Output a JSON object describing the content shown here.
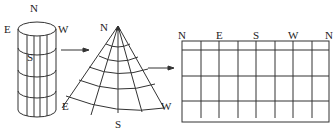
{
  "diagram": {
    "title": "",
    "cylinder": {
      "labels": {
        "north": "N",
        "east": "E",
        "west": "W",
        "south": "S"
      }
    },
    "cone_fan": {
      "labels": {
        "north": "N",
        "east": "E",
        "west": "W",
        "south": "S"
      }
    },
    "grid": {
      "top_labels": [
        "N",
        "E",
        "S",
        "W",
        "N"
      ]
    }
  }
}
